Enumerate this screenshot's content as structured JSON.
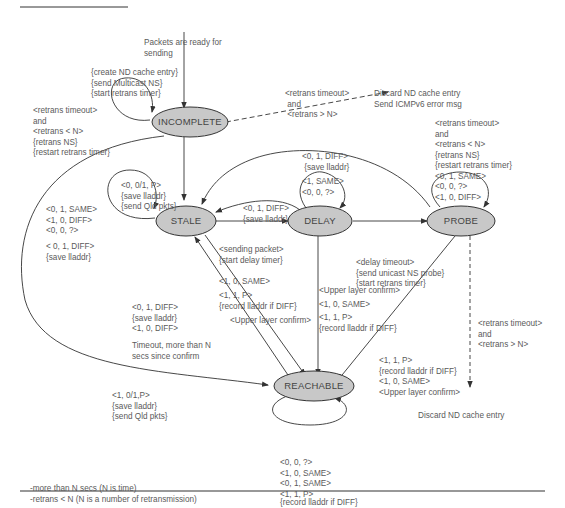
{
  "diagram": {
    "colors": {
      "state_fill": "#c8c8c8",
      "state_stroke": "#333333",
      "line": "#333333",
      "text": "#5a5a5a"
    },
    "states": {
      "incomplete": "INCOMPLETE",
      "stale": "STALE",
      "delay": "DELAY",
      "probe": "PROBE",
      "reachable": "REACHABLE"
    },
    "labels": {
      "start": [
        "Packets are ready for",
        "sending"
      ],
      "start_actions": [
        "{create ND cache entry}",
        "{send Multicast NS}",
        "{start retrans timer}"
      ],
      "incomplete_loop": [
        "<retrans timeout>",
        "and",
        "<retrans < N>",
        "{retrans NS}",
        "{restart retrans timer}"
      ],
      "incomplete_fail": [
        "<retrans timeout>",
        " and",
        " <retrans > N>"
      ],
      "incomplete_fail_result": [
        "Discard ND cache entry",
        "Send ICMPv6 error msg"
      ],
      "incomplete_to_stale": [
        "<0, 0/1, P>",
        "{save lladdr}",
        "{send Qld pkts}"
      ],
      "stale_loop_a": [
        "<0, 1, SAME>",
        "<1, 0, DIFF>",
        "<0, 0, ?>"
      ],
      "stale_loop_b": [
        "< 0, 1, DIFF>",
        "{save lladdr}"
      ],
      "probe_to_stale": [
        "<0, 1, DIFF>",
        " {save lladdr}"
      ],
      "probe_loop_top": [
        "<1, SAME>",
        "<0, 0, ?>"
      ],
      "delay_to_stale": [
        "<0, 1, DIFF>",
        "{save lladdr}"
      ],
      "stale_to_delay": [
        "<sending packet>",
        "{start delay timer}"
      ],
      "probe_loop": [
        "<retrans timeout>",
        "and",
        "<retrans < N>",
        "{retrans NS}",
        "{restart retrans timer}",
        "<0, 1, SAME>",
        "<0, 0, ?>",
        "<1, 0, DIFF>"
      ],
      "delay_to_probe": [
        "<delay timeout>",
        "{send unicast NS probe}",
        "{start retrans timer}"
      ],
      "delay_to_reachable": [
        "<Upper layer confirm>",
        "<1, 0, SAME>",
        "<1, 1, P>",
        "{record lladdr if DIFF}"
      ],
      "stale_to_reachable_a": [
        "<1, 0, SAME>"
      ],
      "stale_to_reachable_b": [
        "<1, 1, P>",
        "{record lladdr if DIFF}"
      ],
      "stale_to_reachable_c": [
        "<Upper layer confirm>"
      ],
      "reachable_to_stale": [
        "<0, 1, DIFF>",
        "{save lladdr}",
        "<1, 0, DIFF>"
      ],
      "reachable_timeout": [
        "Timeout, more than N",
        "secs since confirm"
      ],
      "probe_fail": [
        "<retrans timeout>",
        "and",
        "<retrans > N>"
      ],
      "probe_to_reachable": [
        "<1, 1, P>",
        "{record lladdr if DIFF}",
        "<1, 0, SAME>",
        "<Upper layer confirm>"
      ],
      "probe_fail_result": [
        "Discard ND cache entry"
      ],
      "incomplete_to_reachable": [
        "<1, 0/1,P>",
        "{save lladdr}",
        "{send Qld pkts}"
      ],
      "reachable_loop": [
        "<0, 0, ?>",
        "<1, 0, SAME>",
        "<0, 1, SAME>",
        "<1, 1, P>",
        "{record lladdr if DIFF}"
      ],
      "notes": [
        "-more than N secs (N is time)",
        "-retrans < N (N is a number of retransmission)"
      ]
    }
  }
}
